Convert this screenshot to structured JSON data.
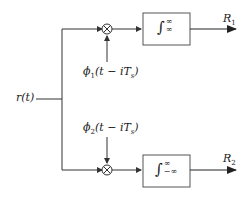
{
  "diagram": {
    "input_label": "r(t)",
    "branches": [
      {
        "basis_label": "ϕ1(t − iTs)",
        "basis_sym": "ϕ",
        "basis_sub": "1",
        "basis_rest": "(t − iT",
        "basis_sub2": "s",
        "basis_close": ")",
        "integral_upper": "∞",
        "integral_lower": "∞",
        "output_label": "R",
        "output_sub": "1"
      },
      {
        "basis_label": "ϕ2(t − iTs)",
        "basis_sym": "ϕ",
        "basis_sub": "2",
        "basis_rest": "(t − iT",
        "basis_sub2": "s",
        "basis_close": ")",
        "integral_upper": "∞",
        "integral_lower": "−∞",
        "output_label": "R",
        "output_sub": "2"
      }
    ],
    "integral_symbol": "∫",
    "multiplier_symbol": "⊗",
    "colors": {
      "line": "#333333",
      "box_border": "#555555"
    }
  }
}
